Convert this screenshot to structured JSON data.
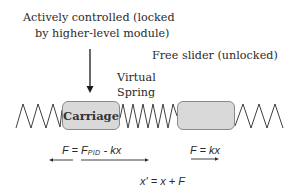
{
  "diagram": {
    "title_line1": "Actively controlled (locked",
    "title_line2": "by higher-level module)",
    "free_slider_label": "Free slider (unlocked)",
    "spring_label_line1": "Virtual",
    "spring_label_line2": "Spring",
    "carriage_label": "Carriage",
    "free_slider_box_label": "",
    "carriage_force": {
      "lhs": "F = F",
      "subscript": "PID",
      "rhs": " - kx"
    },
    "slider_force": "F = kx",
    "position_update": "x' = x + F",
    "colors": {
      "box_fill": "#d9d9d9",
      "box_border": "#8a8a8a",
      "line": "#2a2a2a",
      "background": "#ffffff"
    }
  }
}
